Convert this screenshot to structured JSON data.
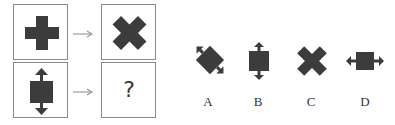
{
  "puzzle": {
    "question_mark": "?",
    "rows": [
      {
        "source": "plus-cross",
        "target": "x-cross"
      },
      {
        "source": "square-vertical-double-arrow",
        "target": "unknown"
      }
    ],
    "arrow_glyph": "→"
  },
  "options": [
    {
      "label": "A",
      "shape": "square-rotated-diagonal-double-arrow"
    },
    {
      "label": "B",
      "shape": "square-vertical-double-arrow"
    },
    {
      "label": "C",
      "shape": "x-cross"
    },
    {
      "label": "D",
      "shape": "square-horizontal-double-arrow"
    }
  ],
  "colors": {
    "shape_fill": "#3c3c3c",
    "border": "#8a8a8a",
    "arrow": "#9a9a9a"
  }
}
